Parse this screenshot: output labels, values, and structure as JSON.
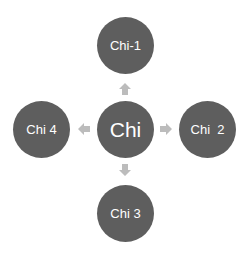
{
  "diagram": {
    "type": "radial",
    "colors": {
      "node_fill": "#5e5e5e",
      "node_text": "#ffffff",
      "arrow_fill": "#bcbcbc",
      "background": "#ffffff"
    },
    "center": {
      "label": "Chi"
    },
    "nodes": [
      {
        "id": "top",
        "label": "Chi-1"
      },
      {
        "id": "right",
        "label": "Chi  2"
      },
      {
        "id": "bottom",
        "label": "Chi 3"
      },
      {
        "id": "left",
        "label": "Chi 4"
      }
    ],
    "edges": [
      {
        "from": "Chi",
        "to": "Chi-1",
        "direction": "up"
      },
      {
        "from": "Chi",
        "to": "Chi  2",
        "direction": "right"
      },
      {
        "from": "Chi",
        "to": "Chi 3",
        "direction": "down"
      },
      {
        "from": "Chi",
        "to": "Chi 4",
        "direction": "left"
      }
    ]
  }
}
